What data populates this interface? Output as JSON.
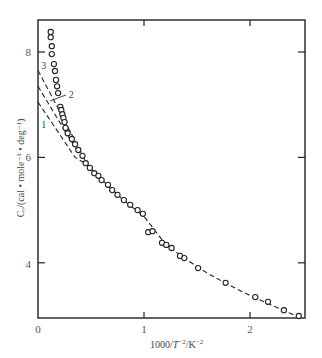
{
  "chart_data": {
    "type": "scatter",
    "title": "",
    "xlabel": "1000/T^2/K^-2",
    "ylabel": "C_V/(cal · mole^-1 · deg^-1)",
    "xlim": [
      0,
      2.53
    ],
    "ylim": [
      2.96,
      8.6
    ],
    "x_ticks": [
      0,
      1,
      2
    ],
    "y_ticks": [
      4,
      6,
      8
    ],
    "grid": false,
    "legend": null,
    "series": [
      {
        "name": "experimental",
        "marker": "open-circle",
        "points": [
          [
            0.12,
            8.38
          ],
          [
            0.12,
            8.28
          ],
          [
            0.13,
            8.11
          ],
          [
            0.13,
            7.96
          ],
          [
            0.15,
            7.77
          ],
          [
            0.16,
            7.64
          ],
          [
            0.17,
            7.47
          ],
          [
            0.18,
            7.35
          ],
          [
            0.19,
            7.22
          ],
          [
            0.21,
            6.96
          ],
          [
            0.22,
            6.9
          ],
          [
            0.23,
            6.82
          ],
          [
            0.24,
            6.75
          ],
          [
            0.25,
            6.67
          ],
          [
            0.26,
            6.56
          ],
          [
            0.28,
            6.46
          ],
          [
            0.32,
            6.35
          ],
          [
            0.35,
            6.25
          ],
          [
            0.38,
            6.14
          ],
          [
            0.42,
            6.03
          ],
          [
            0.45,
            5.89
          ],
          [
            0.49,
            5.8
          ],
          [
            0.53,
            5.7
          ],
          [
            0.57,
            5.65
          ],
          [
            0.6,
            5.57
          ],
          [
            0.66,
            5.48
          ],
          [
            0.7,
            5.38
          ],
          [
            0.75,
            5.29
          ],
          [
            0.81,
            5.19
          ],
          [
            0.87,
            5.1
          ],
          [
            0.94,
            5.0
          ],
          [
            0.99,
            4.93
          ],
          [
            1.04,
            4.58
          ],
          [
            1.08,
            4.6
          ],
          [
            1.17,
            4.38
          ],
          [
            1.21,
            4.34
          ],
          [
            1.26,
            4.28
          ],
          [
            1.34,
            4.13
          ],
          [
            1.38,
            4.09
          ],
          [
            1.51,
            3.9
          ],
          [
            1.77,
            3.62
          ],
          [
            2.05,
            3.35
          ],
          [
            2.17,
            3.26
          ],
          [
            2.32,
            3.1
          ],
          [
            2.46,
            2.99
          ]
        ]
      },
      {
        "name": "1",
        "style": "dashed",
        "points": [
          [
            0.0,
            7.05
          ],
          [
            0.35,
            6.0
          ],
          [
            0.45,
            5.88
          ]
        ]
      },
      {
        "name": "2",
        "style": "dashed",
        "points": [
          [
            0.0,
            7.35
          ],
          [
            0.3,
            6.35
          ],
          [
            0.45,
            5.9
          ]
        ]
      },
      {
        "name": "3",
        "style": "dashed",
        "points": [
          [
            0.0,
            7.65
          ],
          [
            0.25,
            6.7
          ],
          [
            0.45,
            5.92
          ]
        ]
      },
      {
        "name": "fit",
        "style": "dashed",
        "points": [
          [
            0.45,
            5.9
          ],
          [
            0.6,
            5.58
          ],
          [
            0.8,
            5.2
          ],
          [
            1.0,
            4.88
          ],
          [
            1.2,
            4.36
          ],
          [
            1.4,
            4.06
          ],
          [
            1.6,
            3.8
          ],
          [
            1.8,
            3.58
          ],
          [
            2.0,
            3.38
          ],
          [
            2.2,
            3.2
          ],
          [
            2.46,
            2.97
          ]
        ]
      }
    ],
    "annotations": [
      {
        "text": "1",
        "x": 0.03,
        "y": 6.55
      },
      {
        "text": "2",
        "x": 0.29,
        "y": 7.12
      },
      {
        "text": "3",
        "x": 0.03,
        "y": 7.68
      }
    ]
  },
  "axes": {
    "x_tick_labels": [
      "0",
      "1",
      "2"
    ],
    "y_tick_labels": [
      "4",
      "6",
      "8"
    ],
    "xlabel_main": "1000/",
    "xlabel_T": "T",
    "xlabel_T_sup": "−2",
    "xlabel_unit": "/K",
    "xlabel_unit_sup": "−2",
    "ylabel_text": "Cᵥ/(cal • mole⁻¹ • deg⁻¹)"
  },
  "curve_labels": [
    "1",
    "2",
    "3"
  ]
}
